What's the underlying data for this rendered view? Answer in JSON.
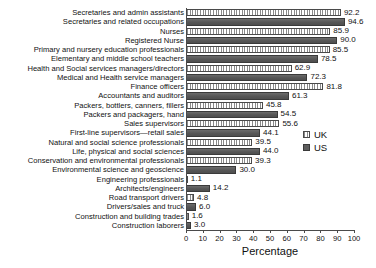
{
  "chart_data": {
    "type": "bar",
    "orientation": "horizontal",
    "title": "",
    "xlabel": "Percentage",
    "ylabel": "",
    "xlim": [
      0,
      100
    ],
    "xticks": [
      0,
      10,
      20,
      30,
      40,
      50,
      60,
      70,
      80,
      90,
      100
    ],
    "grid": false,
    "legend_position": "right",
    "series": [
      {
        "name": "UK",
        "color": "#ffffff",
        "pattern": "vertical-hatch"
      },
      {
        "name": "US",
        "color": "#5d5d5d",
        "pattern": "solid"
      }
    ],
    "categories": [
      "Secretaries and admin assistants",
      "Secretaries and related occupations",
      "Nurses",
      "Registered Nurse",
      "Primary and nursery education professionals",
      "Elementary and middle school teachers",
      "Health and Social services managers/directors",
      "Medical and Health service managers",
      "Finance officers",
      "Accountants and auditors",
      "Packers, bottlers, canners, fillers",
      "Packers and packagers, hand",
      "Sales supervisors",
      "First-line supervisors—retail sales",
      "Natural and social science professionals",
      "Life, physical and social sciences",
      "Conservation and environmental professionals",
      "Environmental science and geoscience",
      "Engineering professionals",
      "Architects/engineers",
      "Road transport drivers",
      "Drivers/sales and truck",
      "Construction and building trades",
      "Construction laborers"
    ],
    "values": [
      92.2,
      94.6,
      85.9,
      90.0,
      85.5,
      78.5,
      62.9,
      72.3,
      81.8,
      61.3,
      45.8,
      54.5,
      55.6,
      44.1,
      39.5,
      44.0,
      39.3,
      30.0,
      1.1,
      14.2,
      4.8,
      6.0,
      1.6,
      3.0
    ],
    "series_of_row": [
      "UK",
      "US",
      "UK",
      "US",
      "UK",
      "US",
      "UK",
      "US",
      "UK",
      "US",
      "UK",
      "US",
      "UK",
      "US",
      "UK",
      "US",
      "UK",
      "US",
      "UK",
      "US",
      "UK",
      "US",
      "UK",
      "US"
    ],
    "value_labels": [
      "92.2",
      "94.6",
      "85.9",
      "90.0",
      "85.5",
      "78.5",
      "62.9",
      "72.3",
      "81.8",
      "61.3",
      "45.8",
      "54.5",
      "55.6",
      "44.1",
      "39.5",
      "44.0",
      "39.3",
      "30.0",
      "1.1",
      "14.2",
      "4.8",
      "6.0",
      "1.6",
      "3.0"
    ]
  },
  "legend": {
    "items": [
      {
        "label": "UK"
      },
      {
        "label": "US"
      }
    ]
  },
  "axis": {
    "xlabel": "Percentage",
    "ticks": [
      "0",
      "10",
      "20",
      "30",
      "40",
      "50",
      "60",
      "70",
      "80",
      "90",
      "100"
    ]
  }
}
